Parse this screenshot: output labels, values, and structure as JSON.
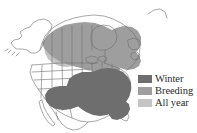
{
  "figure": {
    "kind": "range-map",
    "region": "North America",
    "background_color": "#ffffff",
    "outline_color": "#6e6e6e",
    "coastline_color": "#555555"
  },
  "legend": {
    "position": "right",
    "items": [
      {
        "label": "Winter",
        "color": "#6e6e6e",
        "swatch_name": "winter-swatch"
      },
      {
        "label": "Breeding",
        "color": "#9e9e9e",
        "swatch_name": "breeding-swatch"
      },
      {
        "label": "All year",
        "color": "#c4c4c4",
        "swatch_name": "all-year-swatch"
      }
    ]
  },
  "map_regions": [
    {
      "name": "canada-breeding-band",
      "category": "Breeding",
      "color": "#9e9e9e"
    },
    {
      "name": "northeast-breeding",
      "category": "Breeding",
      "color": "#9e9e9e"
    },
    {
      "name": "prairie-all-year",
      "category": "All year",
      "color": "#c4c4c4"
    },
    {
      "name": "southeast-winter",
      "category": "Winter",
      "color": "#6e6e6e"
    },
    {
      "name": "texas-mexico-winter",
      "category": "Winter",
      "color": "#6e6e6e"
    }
  ],
  "map_features": [
    {
      "name": "alaska",
      "filled": false
    },
    {
      "name": "greenland-edge",
      "filled": false
    },
    {
      "name": "western-united-states",
      "filled": false
    },
    {
      "name": "mexico",
      "filled": false
    },
    {
      "name": "hudson-bay",
      "filled": false
    },
    {
      "name": "great-lakes",
      "filled": false
    }
  ]
}
